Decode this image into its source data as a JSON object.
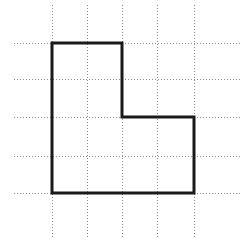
{
  "figure": {
    "canvas": {
      "width": 248,
      "height": 246,
      "background": "#ffffff"
    },
    "grid": {
      "style": "dotted",
      "color": "#8c8c8c",
      "stroke_width": 1,
      "dash_pattern": "1 2",
      "vertical_lines_x": [
        52,
        87,
        122,
        157,
        194
      ],
      "horizontal_lines_y": [
        43,
        79,
        117,
        156,
        193
      ],
      "vertical_extent_y": [
        5,
        238
      ],
      "horizontal_extent_x": [
        14,
        240
      ],
      "cell_width": 35,
      "cell_height": 37,
      "columns": 4,
      "rows": 4
    },
    "shape": {
      "name": "L-shape",
      "type": "polygon",
      "sides": 6,
      "color": "#1a1a1a",
      "stroke_width": 3,
      "fill": "none",
      "vertices": [
        {
          "x": 52,
          "y": 43,
          "label": "top-left"
        },
        {
          "x": 122,
          "y": 43,
          "label": "top-right"
        },
        {
          "x": 122,
          "y": 117,
          "label": "inner-right"
        },
        {
          "x": 194,
          "y": 117,
          "label": "notch-right"
        },
        {
          "x": 194,
          "y": 193,
          "label": "bottom-right"
        },
        {
          "x": 52,
          "y": 193,
          "label": "bottom-left"
        }
      ],
      "edges": [
        {
          "from": 0,
          "to": 1,
          "orientation": "horizontal",
          "length_cells": 2
        },
        {
          "from": 1,
          "to": 2,
          "orientation": "vertical",
          "length_cells": 2
        },
        {
          "from": 2,
          "to": 3,
          "orientation": "horizontal",
          "length_cells": 2
        },
        {
          "from": 3,
          "to": 4,
          "orientation": "vertical",
          "length_cells": 2
        },
        {
          "from": 4,
          "to": 5,
          "orientation": "horizontal",
          "length_cells": 4
        },
        {
          "from": 5,
          "to": 0,
          "orientation": "vertical",
          "length_cells": 4
        }
      ],
      "area_cells": 12,
      "perimeter_cells": 16
    }
  }
}
